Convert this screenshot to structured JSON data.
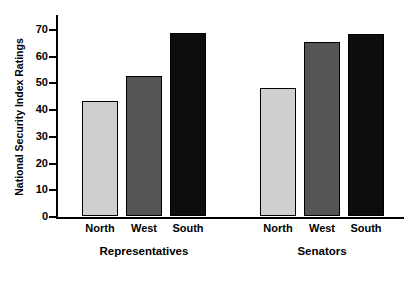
{
  "chart_data": {
    "type": "bar",
    "title": "",
    "xlabel": "",
    "ylabel": "National Security Index Ratings",
    "ylim": [
      0,
      70
    ],
    "ytick_values": [
      0,
      10,
      20,
      30,
      40,
      50,
      60,
      70
    ],
    "ytick_labels": [
      "0",
      "10",
      "20",
      "30",
      "40",
      "50",
      "60",
      "70"
    ],
    "grid": false,
    "legend": "none",
    "groups": [
      {
        "label": "Representatives",
        "categories": [
          "North",
          "West",
          "South"
        ],
        "values": [
          43,
          52.5,
          68.5
        ],
        "colors": [
          "#cfcfcf",
          "#555555",
          "#0d0d0d"
        ]
      },
      {
        "label": "Senators",
        "categories": [
          "North",
          "West",
          "South"
        ],
        "values": [
          48,
          65,
          68
        ],
        "colors": [
          "#cfcfcf",
          "#555555",
          "#0d0d0d"
        ]
      }
    ],
    "categories": [
      "North",
      "West",
      "South"
    ],
    "series": [
      {
        "name": "Representatives",
        "values": [
          43,
          52.5,
          68.5
        ]
      },
      {
        "name": "Senators",
        "values": [
          48,
          65,
          68
        ]
      }
    ],
    "colors": {
      "north": "#cfcfcf",
      "west": "#555555",
      "south": "#0d0d0d",
      "axis": "#000000",
      "background": "#ffffff"
    }
  }
}
